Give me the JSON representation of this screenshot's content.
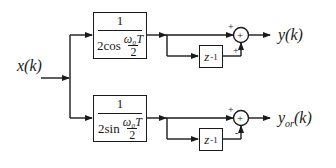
{
  "diagram": {
    "type": "signal-flow block diagram",
    "input": {
      "label": "x(k)"
    },
    "branches": [
      {
        "id": "top",
        "gain_block": {
          "numerator": "1",
          "denominator_prefix": "2cos",
          "denominator_fraction_top": "ω₀T",
          "denominator_fraction_bottom": "2"
        },
        "delay_block": {
          "base": "z",
          "exponent": "-1"
        },
        "summer": {
          "symbol": "+",
          "input_signs": [
            "+",
            "+"
          ]
        },
        "output": {
          "label": "y(k)"
        }
      },
      {
        "id": "bottom",
        "gain_block": {
          "numerator": "1",
          "denominator_prefix": "2sin",
          "denominator_fraction_top": "ω₀T",
          "denominator_fraction_bottom": "2"
        },
        "delay_block": {
          "base": "z",
          "exponent": "-1"
        },
        "summer": {
          "symbol": "+",
          "input_signs": [
            "+",
            "-"
          ]
        },
        "output": {
          "label": "y",
          "subscript": "or",
          "suffix": "(k)"
        }
      }
    ],
    "colors": {
      "line": "#1a1a1a",
      "background": "#ffffff"
    }
  }
}
